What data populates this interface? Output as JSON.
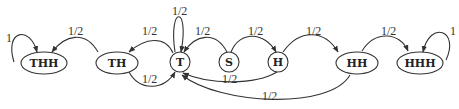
{
  "diagram": {
    "type": "state-transition",
    "nodes": [
      {
        "id": "THH",
        "label": "THH",
        "shape": "ellipse"
      },
      {
        "id": "TH",
        "label": "TH",
        "shape": "ellipse"
      },
      {
        "id": "T",
        "label": "T",
        "shape": "circle"
      },
      {
        "id": "S",
        "label": "S",
        "shape": "circle"
      },
      {
        "id": "H",
        "label": "H",
        "shape": "circle"
      },
      {
        "id": "HH",
        "label": "HH",
        "shape": "ellipse"
      },
      {
        "id": "HHH",
        "label": "HHH",
        "shape": "ellipse"
      }
    ],
    "edges": [
      {
        "from": "THH",
        "to": "THH",
        "label": "1"
      },
      {
        "from": "TH",
        "to": "THH",
        "label": "1/2"
      },
      {
        "from": "T",
        "to": "TH",
        "label": "1/2"
      },
      {
        "from": "TH",
        "to": "T",
        "label": "1/2"
      },
      {
        "from": "T",
        "to": "T",
        "label": "1/2"
      },
      {
        "from": "S",
        "to": "T",
        "label": "1/2"
      },
      {
        "from": "S",
        "to": "H",
        "label": "1/2"
      },
      {
        "from": "H",
        "to": "T",
        "label": "1/2"
      },
      {
        "from": "H",
        "to": "HH",
        "label": "1/2"
      },
      {
        "from": "HH",
        "to": "T",
        "label": "1/2"
      },
      {
        "from": "HH",
        "to": "HHH",
        "label": "1/2"
      },
      {
        "from": "HHH",
        "to": "HHH",
        "label": "1"
      }
    ]
  }
}
